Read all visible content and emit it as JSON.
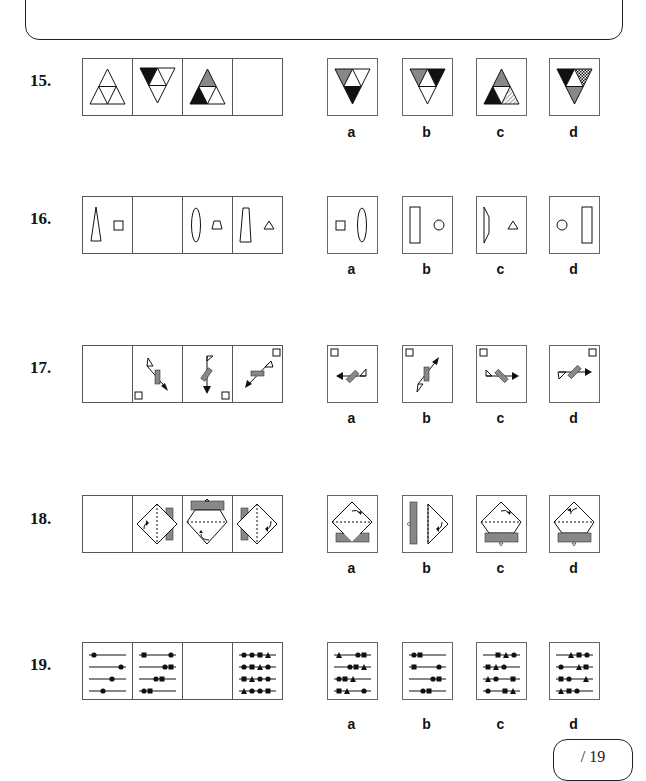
{
  "page": {
    "score": {
      "text": "/ 19",
      "total": 19
    }
  },
  "questions": [
    {
      "number_label": "15.",
      "description": "Triangle sequence of four-section triangles with black/grey shading; last cell blank",
      "sequence": [
        "upright triangle, all white",
        "inverted triangle, top-left black",
        "upright triangle, top grey, bottom-left black",
        "blank"
      ],
      "options": [
        {
          "label": "a",
          "desc": "inverted triangle: top-left grey, bottom black"
        },
        {
          "label": "b",
          "desc": "inverted triangle: top-left grey, top-right black"
        },
        {
          "label": "c",
          "desc": "upright triangle: top grey, bottom-left black, bottom-right hatched"
        },
        {
          "label": "d",
          "desc": "inverted triangle: top-left black, top-right checked, bottom grey"
        }
      ]
    },
    {
      "number_label": "16.",
      "description": "Pairs of outline shapes; second cell blank",
      "sequence": [
        "tall triangle + square",
        "blank",
        "ellipse + trapezoid",
        "trapezoid + triangle"
      ],
      "options": [
        {
          "label": "a",
          "desc": "square + ellipse"
        },
        {
          "label": "b",
          "desc": "rectangle + circle"
        },
        {
          "label": "c",
          "desc": "half-trapezoid + triangle"
        },
        {
          "label": "d",
          "desc": "circle + rectangle"
        }
      ]
    },
    {
      "number_label": "17.",
      "description": "Rotating arrow with grey bar, flag and corner square; first cell blank",
      "sequence": [
        "blank",
        "arrow down-right, square bottom-left",
        "arrow down, square bottom-right",
        "arrow down-left, square top-right"
      ],
      "options": [
        {
          "label": "a",
          "desc": "arrow left, square top-left"
        },
        {
          "label": "b",
          "desc": "arrow up-right, square top-left"
        },
        {
          "label": "c",
          "desc": "arrow right, square top-left"
        },
        {
          "label": "d",
          "desc": "arrow right, square top-right"
        }
      ]
    },
    {
      "number_label": "18.",
      "description": "Diamond with dashed diagonal, grey bar and curved arrow; first cell blank",
      "sequence": [
        "blank",
        "bar right",
        "bar top",
        "bar left"
      ],
      "options": [
        {
          "label": "a",
          "desc": "bar bottom behind diamond"
        },
        {
          "label": "b",
          "desc": "bar left"
        },
        {
          "label": "c",
          "desc": "bar bottom, arrow top-right"
        },
        {
          "label": "d",
          "desc": "bar bottom, arrow top-left"
        }
      ]
    },
    {
      "number_label": "19.",
      "description": "Four lines with beads (circle, square, triangle); third cell blank",
      "sequence": [
        "one circle per line",
        "circle + square per line",
        "blank",
        "four symbols per line"
      ],
      "options": [
        {
          "label": "a",
          "desc": "three symbols per line variant a"
        },
        {
          "label": "b",
          "desc": "two symbols per line"
        },
        {
          "label": "c",
          "desc": "three symbols per line variant c"
        },
        {
          "label": "d",
          "desc": "three symbols per line variant d"
        }
      ]
    }
  ]
}
